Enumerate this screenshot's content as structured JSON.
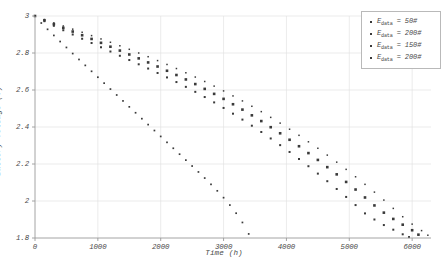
{
  "chart_data": {
    "type": "scatter",
    "title": "",
    "xlabel": "Time (h)",
    "ylabel": "Battery Voltage (V)",
    "xlim": [
      0,
      6300
    ],
    "ylim": [
      1.8,
      3.0
    ],
    "xticks": [
      0,
      1000,
      2000,
      3000,
      4000,
      5000,
      6000
    ],
    "xtick_labels": [
      "0",
      "1000",
      "2000",
      "3000",
      "4000",
      "5000",
      "6000"
    ],
    "yticks": [
      1.8,
      2.0,
      2.2,
      2.4,
      2.6,
      2.8,
      3.0
    ],
    "ytick_labels": [
      "1.8",
      "2",
      "2.2",
      "2.4",
      "2.6",
      "2.8",
      "3"
    ],
    "grid": true,
    "grid_color": "#e2e2e2",
    "axis_color": "#9a9a9a",
    "marker_color": "#3a3a3a",
    "legend_position": "top-right",
    "legend_entries": [
      "E_data = 50#",
      "E_data = 200#",
      "E_data = 150#",
      "E_data = 200#"
    ],
    "series": [
      {
        "name": "E_data = 50#",
        "label_prefix": "E",
        "label_sub": "data",
        "label_value": "= 50#",
        "marker": "square",
        "marker_size": 1.7,
        "x": [
          0,
          100,
          200,
          300,
          400,
          500,
          600,
          700,
          800,
          900,
          1000,
          1100,
          1200,
          1300,
          1400,
          1500,
          1600,
          1700,
          1800,
          1900,
          2000,
          2100,
          2200,
          2300,
          2400,
          2500,
          2600,
          2700,
          2800,
          2900,
          3000,
          3100,
          3200,
          3300,
          3400
        ],
        "y": [
          3.0,
          2.962,
          2.928,
          2.895,
          2.862,
          2.83,
          2.797,
          2.765,
          2.733,
          2.701,
          2.669,
          2.637,
          2.605,
          2.573,
          2.541,
          2.509,
          2.477,
          2.445,
          2.413,
          2.381,
          2.349,
          2.317,
          2.285,
          2.253,
          2.221,
          2.189,
          2.157,
          2.124,
          2.09,
          2.055,
          2.018,
          1.978,
          1.934,
          1.884,
          1.822
        ]
      },
      {
        "name": "E_data = 200#",
        "label_prefix": "E",
        "label_sub": "data",
        "label_value": "= 200#",
        "marker": "square",
        "marker_size": 2.0,
        "x": [
          0,
          150,
          300,
          450,
          600,
          750,
          900,
          1050,
          1200,
          1350,
          1500,
          1650,
          1800,
          1950,
          2100,
          2250,
          2400,
          2550,
          2700,
          2850,
          3000,
          3150,
          3300,
          3450,
          3600,
          3750,
          3900,
          4050,
          4200,
          4350,
          4500,
          4650,
          4800,
          4950,
          5100,
          5250,
          5400,
          5550,
          5700,
          5850,
          5950
        ],
        "y": [
          3.0,
          2.972,
          2.947,
          2.923,
          2.9,
          2.877,
          2.854,
          2.831,
          2.808,
          2.785,
          2.762,
          2.739,
          2.716,
          2.692,
          2.668,
          2.643,
          2.617,
          2.59,
          2.562,
          2.533,
          2.503,
          2.472,
          2.44,
          2.407,
          2.373,
          2.338,
          2.302,
          2.265,
          2.227,
          2.188,
          2.148,
          2.107,
          2.065,
          2.022,
          1.978,
          1.933,
          1.9,
          1.87,
          1.845,
          1.82,
          1.805
        ]
      },
      {
        "name": "E_data = 150#",
        "label_prefix": "E",
        "label_sub": "data",
        "label_value": "= 150#",
        "marker": "square",
        "marker_size": 2.6,
        "x": [
          0,
          150,
          300,
          450,
          600,
          750,
          900,
          1050,
          1200,
          1350,
          1500,
          1650,
          1800,
          1950,
          2100,
          2250,
          2400,
          2550,
          2700,
          2850,
          3000,
          3150,
          3300,
          3450,
          3600,
          3750,
          3900,
          4050,
          4200,
          4350,
          4500,
          4650,
          4800,
          4950,
          5100,
          5250,
          5400,
          5550,
          5700,
          5850,
          6000,
          6100
        ],
        "y": [
          3.0,
          2.977,
          2.956,
          2.936,
          2.916,
          2.896,
          2.876,
          2.855,
          2.834,
          2.813,
          2.792,
          2.771,
          2.749,
          2.727,
          2.704,
          2.681,
          2.657,
          2.632,
          2.606,
          2.579,
          2.552,
          2.523,
          2.494,
          2.463,
          2.432,
          2.399,
          2.366,
          2.331,
          2.296,
          2.259,
          2.222,
          2.183,
          2.144,
          2.103,
          2.062,
          2.019,
          1.976,
          1.937,
          1.903,
          1.872,
          1.842,
          1.818
        ]
      },
      {
        "name": "E_data = 200#",
        "label_prefix": "E",
        "label_sub": "data",
        "label_value": "= 200#",
        "marker": "square",
        "marker_size": 1.5,
        "x": [
          0,
          150,
          300,
          450,
          600,
          750,
          900,
          1050,
          1200,
          1350,
          1500,
          1650,
          1800,
          1950,
          2100,
          2250,
          2400,
          2550,
          2700,
          2850,
          3000,
          3150,
          3300,
          3450,
          3600,
          3750,
          3900,
          4050,
          4200,
          4350,
          4500,
          4650,
          4800,
          4950,
          5100,
          5250,
          5400,
          5550,
          5700,
          5850,
          6000,
          6150,
          6250
        ],
        "y": [
          3.0,
          2.981,
          2.963,
          2.946,
          2.929,
          2.912,
          2.894,
          2.876,
          2.858,
          2.839,
          2.82,
          2.8,
          2.78,
          2.759,
          2.738,
          2.716,
          2.693,
          2.67,
          2.646,
          2.621,
          2.595,
          2.568,
          2.541,
          2.512,
          2.483,
          2.452,
          2.421,
          2.388,
          2.355,
          2.32,
          2.285,
          2.248,
          2.21,
          2.171,
          2.131,
          2.09,
          2.048,
          2.005,
          1.96,
          1.915,
          1.875,
          1.84,
          1.815
        ]
      }
    ]
  }
}
